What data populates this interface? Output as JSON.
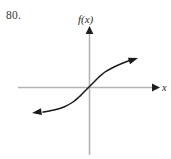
{
  "figure": {
    "problem_number": "80.",
    "background_color": "#ffffff"
  },
  "axes": {
    "color": "#b3b3b3",
    "arrow_color": "#1f1f1f",
    "y_label": "f(x)",
    "x_label": "x",
    "origin": {
      "x": 89,
      "y": 87
    },
    "x_axis": {
      "start_x": 18,
      "end_x": 158,
      "y": 87
    },
    "y_axis": {
      "x": 89,
      "start_y": 28,
      "end_y": 155
    }
  },
  "chart_data": {
    "type": "line",
    "title": "80.",
    "xlabel": "x",
    "ylabel": "f(x)",
    "grid": false,
    "legend": null,
    "curve_color": "#1a1a1a",
    "arrowheads": [
      "start",
      "end"
    ],
    "xlim": [
      -2.6,
      2.6
    ],
    "ylim": [
      -1.7,
      1.7
    ],
    "x": [
      -2.6,
      -2.2,
      -1.8,
      -1.4,
      -1.0,
      -0.7,
      -0.45,
      -0.25,
      -0.1,
      0.0,
      0.1,
      0.25,
      0.45,
      0.7,
      1.0,
      1.4,
      1.8,
      2.2,
      2.6
    ],
    "y": [
      -1.05,
      -1.02,
      -0.98,
      -0.92,
      -0.82,
      -0.7,
      -0.56,
      -0.38,
      -0.17,
      0.0,
      0.17,
      0.38,
      0.56,
      0.7,
      0.82,
      0.92,
      0.98,
      1.02,
      1.05
    ],
    "points_px": [
      [
        32,
        113
      ],
      [
        43,
        112
      ],
      [
        54,
        110
      ],
      [
        64,
        107
      ],
      [
        73,
        102
      ],
      [
        79,
        97
      ],
      [
        83,
        93
      ],
      [
        86,
        90
      ],
      [
        88,
        88
      ],
      [
        89,
        87
      ],
      [
        90,
        86
      ],
      [
        92,
        84
      ],
      [
        95,
        81
      ],
      [
        99,
        77
      ],
      [
        105,
        72
      ],
      [
        114,
        67
      ],
      [
        123,
        63
      ],
      [
        131,
        60
      ],
      [
        138,
        58
      ]
    ]
  }
}
